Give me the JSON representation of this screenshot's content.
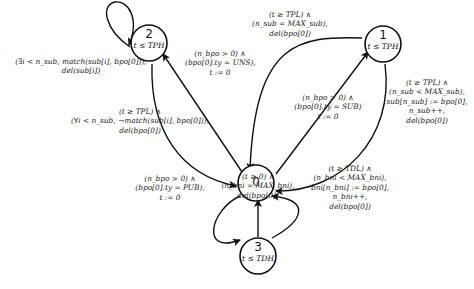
{
  "states": [
    {
      "id": "0",
      "invariant": ""
    },
    {
      "id": "1",
      "invariant": "t ≤ TPH"
    },
    {
      "id": "2",
      "invariant": "t ≤ TPH"
    },
    {
      "id": "3",
      "invariant": "t ≤ TDH"
    }
  ],
  "transitions": {
    "self2": [
      "(∃i < n_sub, match(sub[i], bpo[0])),",
      "del(sub[i])"
    ],
    "t0to2": [
      "(n_bpo > 0) ∧",
      "(bpo[0].ty = UNS),",
      "t := 0"
    ],
    "t2to0": [
      "(t ≥ TPL) ∧",
      "(∀i < n_sub, ¬match(sub[i], bpo[0])),",
      "del(bpo[0])"
    ],
    "t1to0_top": [
      "(t ≥ TPL) ∧",
      "(n_sub = MAX_sub),",
      "del(bpo[0])"
    ],
    "t0to1": [
      "(n_bpo > 0) ∧",
      "(bpo[0].ty = SUB)",
      "t := 0"
    ],
    "t1to0_right": [
      "(t ≥ TPL) ∧",
      "(n_sub < MAX_sub),",
      "sub[n_sub] := bpo[0],",
      "n_sub++,",
      "del(bpo[0])"
    ],
    "t0to3": [
      "(n_bpo > 0) ∧",
      "(bpo[0].ty = PUB),",
      "t := 0"
    ],
    "t3to0_mid": [
      "(t ≥ 0) ∧",
      "(n_bni = MAX_bni),",
      "del(bpo[0])"
    ],
    "t3to0_right": [
      "(t ≥ TDL) ∧",
      "(n_bni < MAX_bni),",
      "bni[n_bni] := bpo[0],",
      "n_bni++,",
      "del(bpo[0])"
    ]
  }
}
